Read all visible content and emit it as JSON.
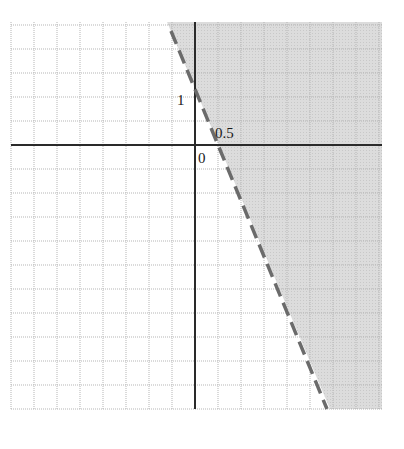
{
  "chart_data": {
    "type": "line",
    "title": "",
    "xlabel": "",
    "ylabel": "",
    "grid": true,
    "grid_step_units": 0.5,
    "xlim": [
      -4,
      4
    ],
    "ylim": [
      -5.5,
      2.5
    ],
    "boundary_line": {
      "equation": "y = -2x + 1",
      "style": "dashed",
      "y_intercept": 1,
      "x_intercept": 0.5,
      "points": [
        [
          -1.0,
          2.4
        ],
        [
          0,
          1
        ],
        [
          0.5,
          0
        ],
        [
          2.85,
          -5.5
        ]
      ]
    },
    "shaded_region": {
      "inequality": "y > -2x + 1",
      "side": "right/above boundary",
      "color": "#d9d9d9"
    },
    "annotations": [
      {
        "text": "1",
        "x": 0,
        "y": 1,
        "position": "left of y-axis"
      },
      {
        "text": "0.5",
        "x": 0.5,
        "y": 0,
        "position": "above x-axis"
      },
      {
        "text": "0",
        "x": 0,
        "y": 0,
        "position": "below-right of origin"
      }
    ]
  },
  "labels": {
    "y_intercept": "1",
    "x_intercept": "0.5",
    "origin": "0"
  },
  "colors": {
    "shade": "#d9d9d9",
    "grid": "#b5b5b5",
    "axis": "#2a2a2a",
    "boundary": "#6b6b6b"
  }
}
